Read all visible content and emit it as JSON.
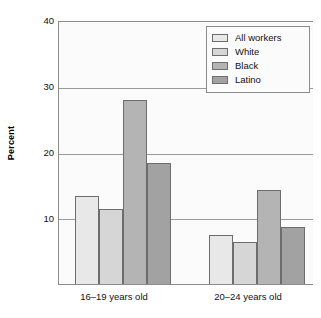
{
  "chart_data": {
    "type": "bar",
    "title": "",
    "xlabel": "",
    "ylabel": "Percent",
    "ylim": [
      0,
      40
    ],
    "yticks": [
      10,
      20,
      30,
      40
    ],
    "ytick_labels": [
      "10",
      "20",
      "30",
      "40"
    ],
    "grid": true,
    "legend_position": "top-right",
    "categories": [
      "16–19 years old",
      "20–24 years old"
    ],
    "series": [
      {
        "name": "All workers",
        "color": "#e8e8e8",
        "values": [
          13.6,
          7.6
        ]
      },
      {
        "name": "White",
        "color": "#d6d6d6",
        "values": [
          11.6,
          6.5
        ]
      },
      {
        "name": "Black",
        "color": "#b4b4b4",
        "values": [
          28.2,
          14.5
        ]
      },
      {
        "name": "Latino",
        "color": "#a2a2a2",
        "values": [
          18.6,
          8.8
        ]
      }
    ]
  },
  "axis": {
    "y_title": "Percent",
    "y_tick_0": "10",
    "y_tick_1": "20",
    "y_tick_2": "30",
    "y_tick_3": "40",
    "x_label_0": "16–19 years old",
    "x_label_1": "20–24 years old"
  },
  "legend": {
    "items": [
      {
        "label": "All workers"
      },
      {
        "label": "White"
      },
      {
        "label": "Black"
      },
      {
        "label": "Latino"
      }
    ]
  }
}
